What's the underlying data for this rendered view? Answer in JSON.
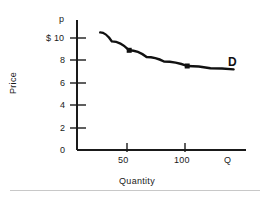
{
  "chart_data": {
    "type": "line",
    "title": "",
    "subtitle": "",
    "xlabel": "Quantity",
    "ylabel": "Price",
    "x_axis_letter": "Q",
    "y_axis_letter": "p",
    "grid": false,
    "legend_position": "inline-right",
    "xlim": [
      0,
      145
    ],
    "ylim": [
      0,
      11
    ],
    "x_ticks": [
      {
        "value": 50,
        "label": "50"
      },
      {
        "value": 100,
        "label": "100"
      }
    ],
    "y_ticks": [
      {
        "value": 0,
        "label": "0"
      },
      {
        "value": 2,
        "label": "2"
      },
      {
        "value": 4,
        "label": "4"
      },
      {
        "value": 6,
        "label": "6"
      },
      {
        "value": 8,
        "label": "8"
      },
      {
        "value": 10,
        "label": "$ 10"
      }
    ],
    "series": [
      {
        "name": "D",
        "label": "D",
        "color": "#111111",
        "curve_points": [
          {
            "x": 20,
            "y": 10.5
          },
          {
            "x": 30,
            "y": 9.7
          },
          {
            "x": 45,
            "y": 8.9
          },
          {
            "x": 60,
            "y": 8.3
          },
          {
            "x": 75,
            "y": 7.9
          },
          {
            "x": 95,
            "y": 7.5
          },
          {
            "x": 115,
            "y": 7.3
          },
          {
            "x": 135,
            "y": 7.2
          }
        ],
        "markers": [
          {
            "x": 45,
            "y": 8.9
          },
          {
            "x": 95,
            "y": 7.5
          }
        ]
      }
    ],
    "annotations": [
      {
        "text": "D",
        "x": 142,
        "y": 7.6,
        "bold": true
      }
    ]
  }
}
